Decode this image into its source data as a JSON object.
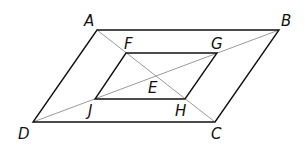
{
  "diagram": {
    "title": "",
    "points": {
      "A": {
        "label": "A",
        "x": 97,
        "y": 30
      },
      "B": {
        "label": "B",
        "x": 279,
        "y": 30
      },
      "C": {
        "label": "C",
        "x": 215,
        "y": 122
      },
      "D": {
        "label": "D",
        "x": 33,
        "y": 122
      },
      "E": {
        "label": "E",
        "x": 156,
        "y": 76
      },
      "F": {
        "label": "F",
        "x": 126,
        "y": 53
      },
      "G": {
        "label": "G",
        "x": 217,
        "y": 53
      },
      "H": {
        "label": "H",
        "x": 185,
        "y": 99
      },
      "J": {
        "label": "J",
        "x": 95,
        "y": 99
      }
    },
    "outer_parallelogram": [
      "A",
      "B",
      "C",
      "D"
    ],
    "inner_parallelogram": [
      "F",
      "G",
      "H",
      "J"
    ],
    "diagonals": [
      [
        "A",
        "C"
      ],
      [
        "D",
        "B"
      ]
    ],
    "colors": {
      "sides": "#111111",
      "diagonals": "#9a9a9a"
    }
  }
}
